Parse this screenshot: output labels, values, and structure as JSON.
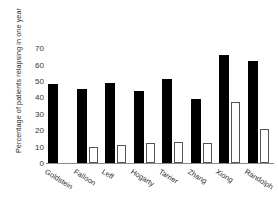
{
  "chart_data": {
    "type": "bar",
    "title": "",
    "xlabel": "",
    "ylabel": "Percentage of patients relapsing in one year",
    "ylim": [
      0,
      75
    ],
    "yticks": [
      0,
      10,
      20,
      30,
      40,
      50,
      60,
      70
    ],
    "grid": false,
    "legend": null,
    "categories": [
      "Goldstein",
      "Falloon",
      "Leff",
      "Hogarty",
      "Tarrier",
      "Zhang",
      "Xiong",
      "Randolph"
    ],
    "series": [
      {
        "name": "control",
        "color": "#000000",
        "values": [
          48,
          45,
          49,
          44,
          51,
          39,
          66,
          62
        ]
      },
      {
        "name": "intervention",
        "color": "#ffffff",
        "values": [
          0,
          10,
          11,
          12,
          13,
          12,
          37,
          21
        ]
      }
    ]
  },
  "axis": {
    "ytick_labels": [
      "0",
      "10",
      "20",
      "30",
      "40",
      "50",
      "60",
      "70"
    ]
  }
}
